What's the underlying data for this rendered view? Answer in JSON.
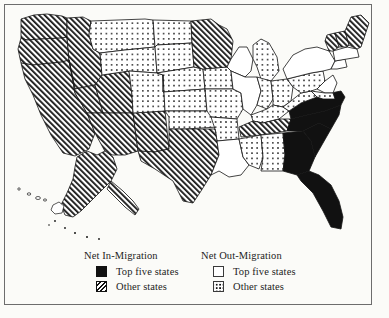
{
  "figure": {
    "kind": "choropleth-map",
    "region": "United States",
    "frame_color": "#6d6d6d",
    "background_color": "#fbfbf8"
  },
  "legend": {
    "in_migration": {
      "title": "Net In-Migration",
      "items": [
        {
          "label": "Top five states",
          "pattern": "solid-black",
          "swatch_class": "sw-solid",
          "icon": "solid-swatch-icon"
        },
        {
          "label": "Other states",
          "pattern": "diagonal-hatch",
          "swatch_class": "sw-hatch",
          "icon": "hatch-swatch-icon"
        }
      ]
    },
    "out_migration": {
      "title": "Net Out-Migration",
      "items": [
        {
          "label": "Top five states",
          "pattern": "white-empty",
          "swatch_class": "sw-empty",
          "icon": "empty-swatch-icon"
        },
        {
          "label": "Other states",
          "pattern": "stipple-dots",
          "swatch_class": "sw-dot",
          "icon": "dotted-swatch-icon"
        }
      ]
    }
  },
  "map_data": {
    "type": "choropleth",
    "categories": [
      "solid-black",
      "diagonal-hatch",
      "white-empty",
      "stipple-dots"
    ],
    "category_meaning": {
      "solid-black": "Net In-Migration: Top five states",
      "diagonal-hatch": "Net In-Migration: Other states",
      "white-empty": "Net Out-Migration: Top five states",
      "stipple-dots": "Net Out-Migration: Other states"
    },
    "states": [
      {
        "code": "WA",
        "pattern": "diagonal-hatch"
      },
      {
        "code": "OR",
        "pattern": "diagonal-hatch"
      },
      {
        "code": "CA",
        "pattern": "diagonal-hatch"
      },
      {
        "code": "ID",
        "pattern": "diagonal-hatch"
      },
      {
        "code": "NV",
        "pattern": "diagonal-hatch"
      },
      {
        "code": "UT",
        "pattern": "diagonal-hatch"
      },
      {
        "code": "AZ",
        "pattern": "diagonal-hatch"
      },
      {
        "code": "NM",
        "pattern": "diagonal-hatch"
      },
      {
        "code": "MT",
        "pattern": "stipple-dots"
      },
      {
        "code": "WY",
        "pattern": "stipple-dots"
      },
      {
        "code": "CO",
        "pattern": "stipple-dots"
      },
      {
        "code": "ND",
        "pattern": "stipple-dots"
      },
      {
        "code": "SD",
        "pattern": "stipple-dots"
      },
      {
        "code": "NE",
        "pattern": "stipple-dots"
      },
      {
        "code": "KS",
        "pattern": "stipple-dots"
      },
      {
        "code": "OK",
        "pattern": "stipple-dots"
      },
      {
        "code": "TX",
        "pattern": "diagonal-hatch"
      },
      {
        "code": "MN",
        "pattern": "diagonal-hatch"
      },
      {
        "code": "IA",
        "pattern": "stipple-dots"
      },
      {
        "code": "MO",
        "pattern": "stipple-dots"
      },
      {
        "code": "AR",
        "pattern": "stipple-dots"
      },
      {
        "code": "LA",
        "pattern": "white-empty"
      },
      {
        "code": "WI",
        "pattern": "white-empty"
      },
      {
        "code": "IL",
        "pattern": "white-empty"
      },
      {
        "code": "MI",
        "pattern": "stipple-dots"
      },
      {
        "code": "IN",
        "pattern": "stipple-dots"
      },
      {
        "code": "OH",
        "pattern": "stipple-dots"
      },
      {
        "code": "KY",
        "pattern": "stipple-dots"
      },
      {
        "code": "TN",
        "pattern": "diagonal-hatch"
      },
      {
        "code": "MS",
        "pattern": "stipple-dots"
      },
      {
        "code": "AL",
        "pattern": "stipple-dots"
      },
      {
        "code": "GA",
        "pattern": "solid-black"
      },
      {
        "code": "FL",
        "pattern": "solid-black"
      },
      {
        "code": "SC",
        "pattern": "solid-black"
      },
      {
        "code": "NC",
        "pattern": "solid-black"
      },
      {
        "code": "VA",
        "pattern": "solid-black"
      },
      {
        "code": "WV",
        "pattern": "stipple-dots"
      },
      {
        "code": "PA",
        "pattern": "stipple-dots"
      },
      {
        "code": "NY",
        "pattern": "white-empty"
      },
      {
        "code": "NJ",
        "pattern": "white-empty"
      },
      {
        "code": "MD",
        "pattern": "stipple-dots"
      },
      {
        "code": "DE",
        "pattern": "stipple-dots"
      },
      {
        "code": "CT",
        "pattern": "white-empty"
      },
      {
        "code": "RI",
        "pattern": "white-empty"
      },
      {
        "code": "MA",
        "pattern": "white-empty"
      },
      {
        "code": "VT",
        "pattern": "diagonal-hatch"
      },
      {
        "code": "NH",
        "pattern": "diagonal-hatch"
      },
      {
        "code": "ME",
        "pattern": "diagonal-hatch"
      },
      {
        "code": "AK",
        "pattern": "diagonal-hatch"
      },
      {
        "code": "HI",
        "pattern": "white-empty"
      }
    ]
  }
}
